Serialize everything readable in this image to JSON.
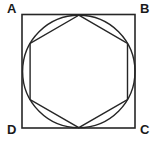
{
  "figure": {
    "canvas": {
      "width": 157,
      "height": 143
    },
    "colors": {
      "background": "#ffffff",
      "stroke": "#262626",
      "label": "#1a1a1a"
    },
    "stroke_widths": {
      "square": 1.6,
      "circle": 1.4,
      "hexagon": 1.4
    },
    "labels": [
      {
        "id": "A",
        "text": "A",
        "corner": "top-left"
      },
      {
        "id": "B",
        "text": "B",
        "corner": "top-right"
      },
      {
        "id": "C",
        "text": "C",
        "corner": "bottom-right"
      },
      {
        "id": "D",
        "text": "D",
        "corner": "bottom-left"
      }
    ],
    "shapes": {
      "square": {
        "name": "square-ABCD",
        "x": 22,
        "y": 14.5,
        "width": 113,
        "height": 113.5,
        "corner_points": {
          "A": [
            22,
            14.5
          ],
          "B": [
            135,
            14.5
          ],
          "C": [
            135,
            128
          ],
          "D": [
            22,
            128
          ]
        }
      },
      "circle": {
        "name": "inscribed-circle",
        "cx": 78.8,
        "cy": 71.4,
        "r": 56.2
      },
      "hexagon": {
        "name": "inscribed-hexagon",
        "points": "78.8,15.2 127.5,43.3 127.5,99.5 78.8,127.6 30.1,99.5 30.1,43.3",
        "vertices": [
          [
            78.8,
            15.2
          ],
          [
            127.5,
            43.3
          ],
          [
            127.5,
            99.5
          ],
          [
            78.8,
            127.6
          ],
          [
            30.1,
            99.5
          ],
          [
            30.1,
            43.3
          ]
        ]
      }
    }
  }
}
